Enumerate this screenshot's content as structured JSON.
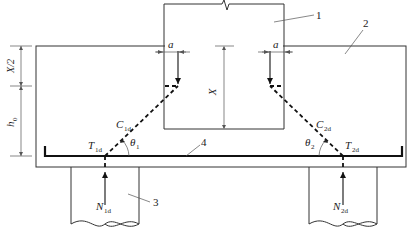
{
  "diagram": {
    "caption": "",
    "parts": [
      {
        "id": "1",
        "name": "column"
      },
      {
        "id": "2",
        "name": "pile cap"
      },
      {
        "id": "3",
        "name": "pile"
      },
      {
        "id": "4",
        "name": "tie reinforcement"
      }
    ],
    "labels": {
      "part1": "1",
      "part2": "2",
      "part3": "3",
      "part4": "4",
      "a_left": "a",
      "a_right": "a",
      "x_half": "X/2",
      "x": "X",
      "h0_main": "h",
      "h0_sub": "0",
      "c1_main": "C",
      "c1_sub": "1d",
      "c2_main": "C",
      "c2_sub": "2d",
      "t1_main": "T",
      "t1_sub": "1d",
      "t2_main": "T",
      "t2_sub": "2d",
      "n1_main": "N",
      "n1_sub": "1d",
      "n2_main": "N",
      "n2_sub": "2d",
      "theta1_main": "θ",
      "theta1_sub": "1",
      "theta2_main": "θ",
      "theta2_sub": "2"
    }
  }
}
